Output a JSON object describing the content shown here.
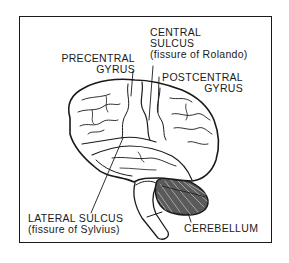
{
  "figure": {
    "colors": {
      "ink": "#1a1a1a",
      "background": "#ffffff"
    },
    "labels": {
      "central_sulcus": {
        "line1": "CENTRAL",
        "line2": "SULCUS",
        "line3": "(fissure of Rolando)"
      },
      "precentral_gyrus": {
        "line1": "PRECENTRAL",
        "line2": "GYRUS"
      },
      "postcentral_gyrus": {
        "line1": "POSTCENTRAL",
        "line2": "GYRUS"
      },
      "lateral_sulcus": {
        "line1": "LATERAL SULCUS",
        "line2": "(fissure of Sylvius)"
      },
      "cerebellum": {
        "line1": "CEREBELLUM"
      }
    }
  }
}
